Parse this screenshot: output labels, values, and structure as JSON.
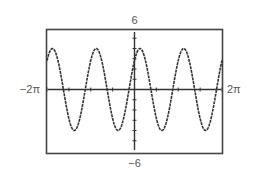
{
  "chart_data": {
    "type": "line",
    "title": "",
    "xlabel": "",
    "ylabel": "",
    "function": "y = 4 sin(2x + π/4)",
    "xlim": [
      -6.2832,
      6.2832
    ],
    "ylim": [
      -6,
      6
    ],
    "x_tick_labels": {
      "min": "−2π",
      "max": "2π"
    },
    "y_tick_labels": {
      "min": "−6",
      "max": "6"
    },
    "grid": false,
    "legend": null,
    "series": [
      {
        "name": "curve",
        "amplitude": 4,
        "period": 3.1416,
        "phase_shift": -0.3927,
        "x": [
          -6.2832,
          -5.8905,
          -5.1051,
          -4.3197,
          -3.5343,
          -2.7489,
          -1.9635,
          -1.1781,
          -0.3927,
          0,
          0.3927,
          1.1781,
          1.9635,
          2.7489,
          3.5343,
          4.3197,
          5.1051,
          5.8905,
          6.2832
        ],
        "values": [
          2.83,
          4,
          0,
          -4,
          0,
          4,
          0,
          -4,
          0,
          2.83,
          4,
          0,
          -4,
          0,
          4,
          0,
          -4,
          0,
          2.83
        ]
      }
    ],
    "colors": {
      "curve": "#333333",
      "axes": "#333333",
      "frame": "#444444",
      "labels": "#555555"
    }
  },
  "labels": {
    "ymax": "6",
    "ymin": "−6",
    "xmin": "−2π",
    "xmax": "2π"
  }
}
